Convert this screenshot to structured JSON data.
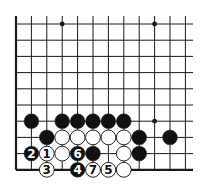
{
  "board": {
    "columns_x": [
      16,
      31.4,
      46.8,
      62.2,
      77.6,
      93,
      108.4,
      123.8,
      139.2,
      154.6,
      170,
      185.4
    ],
    "rows_y": [
      24,
      40.2,
      56.4,
      72.6,
      88.8,
      105,
      121.2,
      137.4,
      153.6,
      169.8
    ],
    "line_top": 16,
    "line_right": 193,
    "left_edge": true,
    "bottom_edge": true,
    "line_color": "#1a1a1a",
    "star_points": [
      {
        "col": 3,
        "row": 0
      },
      {
        "col": 9,
        "row": 0
      },
      {
        "col": 9,
        "row": 6
      }
    ]
  },
  "stones": [
    {
      "col": 1,
      "row": 6,
      "color": "black",
      "label": ""
    },
    {
      "col": 3,
      "row": 6,
      "color": "black",
      "label": ""
    },
    {
      "col": 4,
      "row": 6,
      "color": "black",
      "label": ""
    },
    {
      "col": 5,
      "row": 6,
      "color": "black",
      "label": ""
    },
    {
      "col": 6,
      "row": 6,
      "color": "black",
      "label": ""
    },
    {
      "col": 7,
      "row": 6,
      "color": "black",
      "label": ""
    },
    {
      "col": 2,
      "row": 7,
      "color": "black",
      "label": ""
    },
    {
      "col": 3,
      "row": 7,
      "color": "white",
      "label": ""
    },
    {
      "col": 4,
      "row": 7,
      "color": "white",
      "label": ""
    },
    {
      "col": 5,
      "row": 7,
      "color": "white",
      "label": ""
    },
    {
      "col": 6,
      "row": 7,
      "color": "white",
      "label": ""
    },
    {
      "col": 7,
      "row": 7,
      "color": "white",
      "label": ""
    },
    {
      "col": 8,
      "row": 7,
      "color": "black",
      "label": ""
    },
    {
      "col": 10,
      "row": 7,
      "color": "black",
      "label": ""
    },
    {
      "col": 1,
      "row": 8,
      "color": "black",
      "label": "2"
    },
    {
      "col": 2,
      "row": 8,
      "color": "white",
      "label": "1"
    },
    {
      "col": 3,
      "row": 8,
      "color": "white",
      "label": ""
    },
    {
      "col": 4,
      "row": 8,
      "color": "black",
      "label": "6"
    },
    {
      "col": 5,
      "row": 8,
      "color": "black",
      "label": ""
    },
    {
      "col": 7,
      "row": 8,
      "color": "white",
      "label": ""
    },
    {
      "col": 8,
      "row": 8,
      "color": "black",
      "label": ""
    },
    {
      "col": 2,
      "row": 9,
      "color": "white",
      "label": "3"
    },
    {
      "col": 4,
      "row": 9,
      "color": "black",
      "label": "4"
    },
    {
      "col": 5,
      "row": 9,
      "color": "white",
      "label": "7"
    },
    {
      "col": 6,
      "row": 9,
      "color": "white",
      "label": "5"
    },
    {
      "col": 7,
      "row": 9,
      "color": "white",
      "label": ""
    }
  ],
  "colors": {
    "black_stone": "#111111",
    "white_stone": "#ffffff",
    "stone_outline": "#222222",
    "background": "#ffffff"
  }
}
